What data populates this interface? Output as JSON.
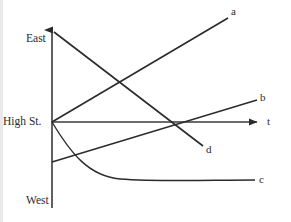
{
  "figure": {
    "type": "line-diagram",
    "background": "#ffffff",
    "ink_color": "#2b2b2b",
    "width": 291,
    "height": 222
  },
  "axes": {
    "vertical": {
      "name": "position-axis",
      "x": 52,
      "top_y": 24,
      "bottom_y": 208,
      "arrow": "up",
      "ticks": [
        {
          "label": "East",
          "y": 39
        },
        {
          "label": "High St.",
          "y": 122
        },
        {
          "label": "West",
          "y": 201
        }
      ]
    },
    "horizontal": {
      "name": "time-axis",
      "y": 122,
      "left_x": 52,
      "right_x": 262,
      "arrow": "right",
      "label": "t",
      "label_x": 268,
      "label_y": 122
    }
  },
  "curves": [
    {
      "id": "a",
      "label": "a",
      "shape": "straight-line",
      "path": "M 52 122 L 228 18",
      "label_x": 233,
      "label_y": 11,
      "start": [
        52,
        122
      ],
      "end": [
        228,
        18
      ]
    },
    {
      "id": "b",
      "label": "b",
      "shape": "straight-line",
      "path": "M 52 162 L 257 100",
      "label_x": 262,
      "label_y": 98,
      "start": [
        52,
        162
      ],
      "end": [
        257,
        100
      ]
    },
    {
      "id": "c",
      "label": "c",
      "shape": "decaying-exponential-curve",
      "path": "M 52 122 C 70 152, 88 176, 120 179 C 160 182, 210 180, 255 180",
      "label_x": 261,
      "label_y": 180,
      "start": [
        52,
        122
      ],
      "end": [
        255,
        180
      ]
    },
    {
      "id": "d",
      "label": "d",
      "shape": "straight-line",
      "path": "M 54 32 L 203 146",
      "label_x": 208,
      "label_y": 150,
      "start": [
        54,
        32
      ],
      "end": [
        203,
        146
      ]
    }
  ]
}
